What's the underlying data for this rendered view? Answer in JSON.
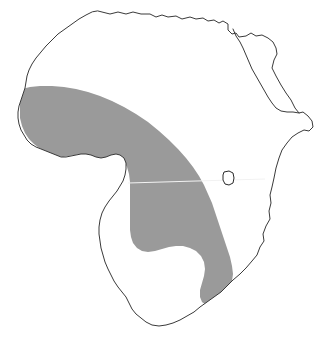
{
  "figure": {
    "type": "distribution-range-map",
    "title": "",
    "caption": "",
    "continent": "Africa",
    "background_color": "#ffffff"
  },
  "map": {
    "outline": {
      "name": "africa-continent-outline",
      "stroke_color": "#3a3a3a",
      "stroke_width": 1,
      "fill_color": "#ffffff"
    },
    "range_overlay": {
      "name": "shaded-distribution-range",
      "fill_color": "#9a9a9a",
      "description": "Shaded range spanning Sahel, West Africa, Congo Basin and East Africa southward to southeastern coast"
    },
    "lake": {
      "name": "lake-victoria",
      "fill_color": "#ffffff",
      "stroke_color": "#2a2a2a"
    },
    "equator": {
      "name": "equator-line",
      "color": "#f2f2f2",
      "width": 1
    },
    "red_sea": {
      "name": "red-sea-inlet",
      "stroke_color": "#3a3a3a"
    }
  },
  "geometry": {
    "africa_path": "M 98 11 L 110 14 L 118 12 L 126 14 L 133 12 L 141 14 L 150 14 L 156 17 L 162 15 L 168 17 L 176 16 L 182 19 L 190 17 L 196 19 L 203 18 L 208 21 L 214 20 L 219 23 L 223 21 L 228 24 L 228 30 L 232 34 L 236 33 L 239 37 L 246 36 L 251 33 L 256 36 L 262 35 L 268 38 L 273 42 L 276 48 L 277 54 L 274 60 L 272 68 L 276 76 L 281 85 L 286 93 L 291 100 L 295 108 L 299 113 L 303 112 L 308 116 L 312 121 L 313 127 L 309 131 L 304 130 L 298 133 L 292 137 L 287 143 L 282 150 L 279 158 L 276 168 L 274 178 L 272 187 L 270 195 L 271 203 L 269 211 L 270 219 L 266 226 L 263 234 L 264 241 L 260 247 L 257 255 L 252 261 L 246 268 L 240 274 L 233 280 L 227 286 L 221 292 L 214 297 L 207 302 L 200 307 L 194 312 L 187 316 L 180 320 L 173 323 L 166 325 L 159 326 L 152 325 L 146 322 L 141 318 L 136 314 L 132 309 L 129 303 L 126 297 L 122 292 L 118 287 L 114 281 L 111 275 L 108 269 L 105 262 L 103 255 L 101 248 L 100 241 L 99 234 L 99 227 L 100 220 L 102 213 L 105 207 L 109 201 L 113 196 L 117 191 L 120 186 L 123 181 L 125 175 L 126 169 L 126 163 L 124 158 L 120 155 L 116 154 L 111 155 L 106 157 L 101 158 L 96 157 L 91 155 L 86 154 L 81 154 L 76 155 L 71 156 L 66 157 L 61 157 L 56 155 L 51 153 L 46 151 L 41 149 L 36 147 L 31 144 L 27 140 L 24 135 L 21 130 L 19 124 L 18 118 L 18 112 L 19 106 L 21 100 L 23 94 L 25 88 L 26 82 L 27 76 L 29 70 L 32 64 L 36 58 L 41 52 L 46 46 L 52 40 L 58 34 L 65 29 L 72 24 L 79 19 L 86 15 L 92 12 Z",
    "range_path": "M 22 89 L 30 87 L 40 86 L 52 86 L 64 87 L 76 89 L 88 92 L 100 96 L 112 101 L 124 107 L 136 114 L 148 122 L 159 131 L 169 140 L 178 149 L 186 158 L 193 167 L 199 176 L 204 185 L 208 194 L 212 203 L 215 212 L 218 221 L 221 230 L 224 239 L 227 248 L 230 257 L 232 266 L 233 274 L 232 281 L 229 288 L 225 294 L 221 299 L 216 303 L 211 305 L 206 305 L 202 302 L 200 297 L 200 290 L 202 283 L 204 276 L 205 269 L 204 262 L 201 256 L 196 251 L 190 248 L 183 246 L 176 246 L 169 247 L 162 249 L 155 251 L 148 252 L 142 251 L 137 248 L 133 243 L 131 237 L 130 230 L 130 222 L 130 214 L 130 206 L 130 198 L 130 190 L 130 182 L 129 174 L 127 167 L 124 161 L 120 157 L 115 156 L 110 157 L 105 158 L 99 158 L 93 157 L 87 155 L 81 154 L 75 155 L 69 156 L 63 157 L 57 156 L 51 154 L 45 151 L 39 148 L 34 144 L 29 139 L 25 133 L 22 126 L 20 118 L 20 110 L 20 101 L 21 94 Z",
    "lake_path": "M 224 172 L 229 171 L 233 173 L 234 178 L 233 183 L 229 185 L 225 184 L 223 180 L 223 175 Z",
    "equator_line": {
      "x1": 128,
      "y1": 183,
      "x2": 265,
      "y2": 179
    },
    "red_sea_path": "M 228 30 L 232 34 L 236 33 L 239 37 L 246 36 L 251 33 L 256 36 L 262 35 L 268 38 L 273 42 L 276 48 L 277 54 L 274 60 L 272 68 L 276 76 L 281 85 L 286 93 L 291 100 L 295 108 L 299 113",
    "red_sea_inner": "M 233 29 L 236 36 L 240 42 L 243 48 L 246 55 L 249 62 L 252 69 L 256 76 L 260 83 L 264 90 L 268 97 L 272 103 L 276 108 L 281 111 L 287 112 L 293 112 L 299 113"
  }
}
